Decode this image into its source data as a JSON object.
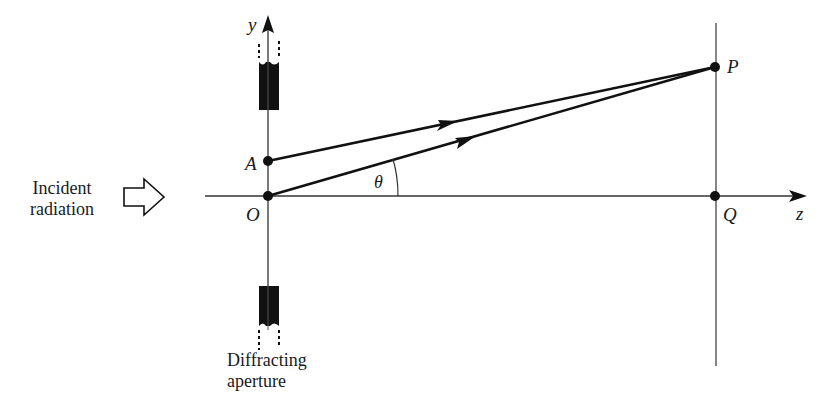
{
  "figure": {
    "labels": {
      "y_axis": "y",
      "z_axis": "z",
      "point_A": "A",
      "point_O": "O",
      "point_P": "P",
      "point_Q": "Q",
      "angle": "θ"
    },
    "incident": {
      "line1": "Incident",
      "line2": "radiation"
    },
    "aperture": {
      "line1": "Diffracting",
      "line2": "aperture"
    },
    "colors": {
      "ink": "#111111",
      "thin_line": "#444444",
      "background": "#ffffff"
    }
  }
}
